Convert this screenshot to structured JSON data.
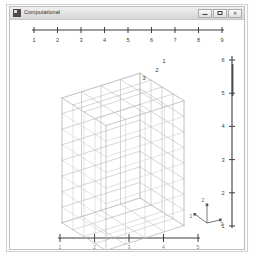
{
  "window": {
    "title": "Computational",
    "app_icon": "app-window-icon",
    "controls": [
      {
        "name": "minimize-button",
        "glyph": "minimize-icon",
        "label": "Minimize"
      },
      {
        "name": "maximize-button",
        "glyph": "maximize-icon",
        "label": "Maximize"
      },
      {
        "name": "close-button",
        "glyph": "close-icon",
        "label": "Close"
      }
    ]
  },
  "chart_data": {
    "type": "scatter",
    "title": "Computational",
    "subtitle": "3D structured hexahedral mesh of a rectangular block",
    "xlabel": "",
    "ylabel": "",
    "grid": false,
    "legend": false,
    "top_axis": {
      "name": "top-ruler",
      "orientation": "horizontal",
      "position": "top",
      "ticks": [
        1,
        2,
        3,
        4,
        5,
        6,
        7,
        8,
        9
      ],
      "tick_labels": [
        "1",
        "2",
        "3",
        "4",
        "5",
        "6",
        "7",
        "8",
        "9"
      ],
      "range": [
        1,
        9
      ]
    },
    "right_axis": {
      "name": "right-ruler",
      "orientation": "vertical",
      "position": "right",
      "ticks": [
        1,
        2,
        3,
        4,
        5,
        6
      ],
      "tick_labels": [
        "6",
        "5",
        "4",
        "3",
        "2",
        "1"
      ],
      "range": [
        1,
        6
      ]
    },
    "bottom_axis": {
      "name": "bottom-ruler",
      "orientation": "horizontal",
      "position": "bottom",
      "ticks": [
        1,
        2,
        3,
        4,
        5
      ],
      "tick_labels": [
        "1",
        "2",
        "3",
        "4",
        "5"
      ],
      "range": [
        1,
        5
      ]
    },
    "corner_labels": [
      "1",
      "2",
      "3"
    ],
    "axis_triad": {
      "name": "axis-triad",
      "axes": [
        "x",
        "y",
        "z"
      ],
      "labels": [
        "1",
        "2",
        "3"
      ]
    },
    "mesh": {
      "shape": "rectangular-block",
      "divisions_x": 4,
      "divisions_y": 4,
      "divisions_z": 8,
      "line_color": "#b9b9b9",
      "face_color": "#ffffff"
    }
  },
  "colors": {
    "mesh_line": "#b9b9b9",
    "mesh_line_dark": "#9a9a9a",
    "axis": "#3d3d3d",
    "tick_label": "#404040",
    "window_bg": "#f4f4f4",
    "client_bg": "#ffffff",
    "titlebar_text": "#2b2b2b"
  }
}
